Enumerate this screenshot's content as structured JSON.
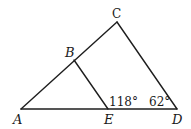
{
  "diagram": {
    "type": "geometry",
    "points": [
      {
        "id": "A",
        "label": "A",
        "x": 21,
        "y": 109
      },
      {
        "id": "B",
        "label": "B",
        "x": 74,
        "y": 60
      },
      {
        "id": "C",
        "label": "C",
        "x": 117,
        "y": 22
      },
      {
        "id": "D",
        "label": "D",
        "x": 177,
        "y": 109
      },
      {
        "id": "E",
        "label": "E",
        "x": 108,
        "y": 109
      }
    ],
    "segments": [
      {
        "from": "A",
        "to": "C"
      },
      {
        "from": "C",
        "to": "D"
      },
      {
        "from": "A",
        "to": "D"
      },
      {
        "from": "B",
        "to": "E"
      }
    ],
    "angles": [
      {
        "at": "E",
        "label": "118°"
      },
      {
        "at": "D",
        "label": "62°"
      }
    ],
    "colors": {
      "stroke": "#1e1e1e",
      "text": "#1a1a1a",
      "background": "#ffffff"
    }
  }
}
